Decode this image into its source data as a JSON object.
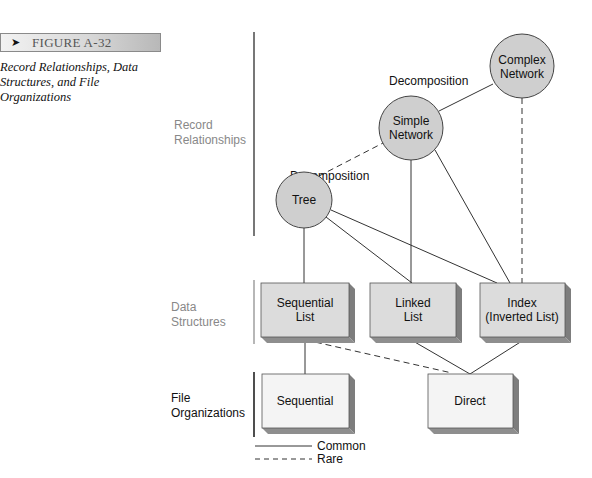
{
  "figure": {
    "arrow_icon": "right-arrowhead-icon",
    "label": "FIGURE A-32",
    "caption_line1": "Record Relationships, Data",
    "caption_line2": "Structures, and File",
    "caption_line3": "Organizations"
  },
  "tiers": {
    "record": {
      "line1": "Record",
      "line2": "Relationships"
    },
    "data": {
      "line1": "Data",
      "line2": "Structures"
    },
    "file": {
      "line1": "File",
      "line2": "Organizations"
    }
  },
  "nodes": {
    "tree": {
      "line1": "Tree"
    },
    "simple_network": {
      "line1": "Simple",
      "line2": "Network"
    },
    "complex_network": {
      "line1": "Complex",
      "line2": "Network"
    },
    "sequential_list": {
      "line1": "Sequential",
      "line2": "List"
    },
    "linked_list": {
      "line1": "Linked",
      "line2": "List"
    },
    "index": {
      "line1": "Index",
      "line2": "(Inverted List)"
    },
    "sequential_file": {
      "line1": "Sequential"
    },
    "direct_file": {
      "line1": "Direct"
    }
  },
  "edge_labels": {
    "decomp_tree_simple": "Decomposition",
    "decomp_simple_complex": "Decomposition"
  },
  "legend": {
    "common": "Common",
    "rare": "Rare"
  },
  "colors": {
    "circle_fill": "#cfcfcf",
    "box_fill_structures": "#dcdcdc",
    "box_fill_files": "#f4f4f4",
    "box_side": "#8a8a8a",
    "line": "#333333"
  },
  "edges": [
    {
      "from": "Tree",
      "to": "Simple Network",
      "type": "Rare",
      "label": "Decomposition"
    },
    {
      "from": "Simple Network",
      "to": "Complex Network",
      "type": "Common",
      "label": "Decomposition"
    },
    {
      "from": "Complex Network",
      "to": "Index (Inverted List)",
      "type": "Rare"
    },
    {
      "from": "Tree",
      "to": "Sequential List",
      "type": "Common"
    },
    {
      "from": "Tree",
      "to": "Linked List",
      "type": "Common"
    },
    {
      "from": "Tree",
      "to": "Index (Inverted List)",
      "type": "Common"
    },
    {
      "from": "Simple Network",
      "to": "Linked List",
      "type": "Common"
    },
    {
      "from": "Simple Network",
      "to": "Index (Inverted List)",
      "type": "Common"
    },
    {
      "from": "Sequential List",
      "to": "Sequential",
      "type": "Common"
    },
    {
      "from": "Sequential List",
      "to": "Direct",
      "type": "Rare"
    },
    {
      "from": "Linked List",
      "to": "Direct",
      "type": "Common"
    },
    {
      "from": "Index (Inverted List)",
      "to": "Direct",
      "type": "Common"
    }
  ]
}
